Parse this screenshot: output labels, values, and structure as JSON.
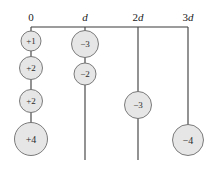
{
  "figure": {
    "background_color": "#ffffff",
    "line_color": "#3b3b3b",
    "circle_fill": "#e6e6e6",
    "circle_stroke": "#6d6d6d",
    "text_color": "#1a1a1a",
    "axis": {
      "name": "horizontal-axis",
      "y": 27,
      "x_start": 31,
      "x_end": 188,
      "ticks": [
        {
          "label": "0",
          "x": 31,
          "italic": false
        },
        {
          "label": "d",
          "x": 85,
          "italic": true
        },
        {
          "label": "2d",
          "x": 138,
          "italic": true
        },
        {
          "label": "3d",
          "x": 188,
          "italic": true
        }
      ]
    },
    "columns": [
      {
        "name": "column-0",
        "tick_label": "0",
        "x": 31,
        "line_top": 27,
        "line_bottom": 155,
        "charges": [
          {
            "label": "+1",
            "cy": 41,
            "r": 10.0,
            "value": 1
          },
          {
            "label": "+2",
            "cy": 68,
            "r": 11.5,
            "value": 2
          },
          {
            "label": "+2",
            "cy": 101,
            "r": 11.5,
            "value": 2
          },
          {
            "label": "+4",
            "cy": 139,
            "r": 16.5,
            "value": 4
          }
        ]
      },
      {
        "name": "column-d",
        "tick_label": "d",
        "x": 85,
        "line_top": 27,
        "line_bottom": 160,
        "charges": [
          {
            "label": "−3",
            "cy": 44,
            "r": 13.5,
            "value": -3
          },
          {
            "label": "−2",
            "cy": 74,
            "r": 11.0,
            "value": -2
          }
        ]
      },
      {
        "name": "column-2d",
        "tick_label": "2d",
        "x": 138,
        "line_top": 27,
        "line_bottom": 160,
        "charges": [
          {
            "label": "−3",
            "cy": 105,
            "r": 13.5,
            "value": -3
          }
        ]
      },
      {
        "name": "column-3d",
        "tick_label": "3d",
        "x": 188,
        "line_top": 27,
        "line_bottom": 125,
        "charges": [
          {
            "label": "−4",
            "cy": 140,
            "r": 15.5,
            "value": -4
          }
        ]
      }
    ]
  }
}
